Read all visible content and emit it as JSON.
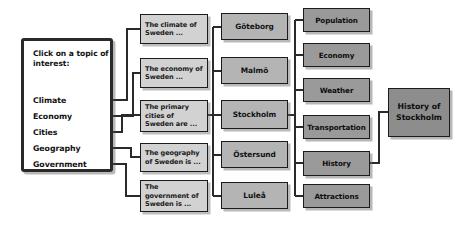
{
  "diagram": {
    "colors": {
      "menu_fill": "#ffffff",
      "menu_border": "#2a2a2a",
      "teaser_fill": "#d2d2d2",
      "city_fill": "#b4b4b4",
      "topic_fill": "#9a9a9a",
      "final_fill": "#8d8d8d",
      "line": "#2a2a2a"
    }
  },
  "menu": {
    "prompt": "Click on a topic of interest:",
    "links": [
      {
        "label": "Climate"
      },
      {
        "label": "Economy"
      },
      {
        "label": "Cities"
      },
      {
        "label": "Geography"
      },
      {
        "label": "Government"
      }
    ]
  },
  "teasers": [
    {
      "label": "The climate of Sweden ..."
    },
    {
      "label": "The economy of Sweden ..."
    },
    {
      "label": "The primary cities of Sweden are ..."
    },
    {
      "label": "The geography of Sweden is ..."
    },
    {
      "label": "The government of Sweden is ..."
    }
  ],
  "cities": [
    {
      "label": "Göteborg"
    },
    {
      "label": "Malmö"
    },
    {
      "label": "Stockholm"
    },
    {
      "label": "Östersund"
    },
    {
      "label": "Luleå"
    }
  ],
  "topics": [
    {
      "label": "Population"
    },
    {
      "label": "Economy"
    },
    {
      "label": "Weather"
    },
    {
      "label": "Transportation"
    },
    {
      "label": "History"
    },
    {
      "label": "Attractions"
    }
  ],
  "final": {
    "label": "History of Stockholm"
  }
}
